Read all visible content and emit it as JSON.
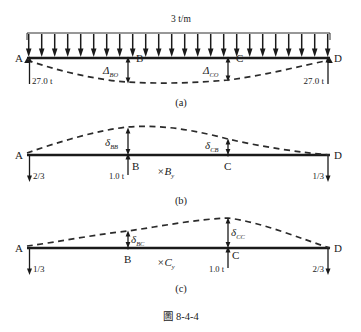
{
  "figure": {
    "caption": "圖 8-4-4",
    "nodes": [
      "A",
      "B",
      "C",
      "D"
    ],
    "panels": [
      {
        "id": "a",
        "panel_label": "(a)",
        "load_label": "3 t/m",
        "load_arrow_count": 24,
        "reaction_left": "27.0 t",
        "reaction_right": "27.0 t",
        "deflection_symbols": [
          {
            "base": "Δ",
            "sub": "BO",
            "at_node": "B"
          },
          {
            "base": "Δ",
            "sub": "CO",
            "at_node": "C"
          }
        ],
        "nodes": [
          "A",
          "B",
          "C",
          "D"
        ],
        "deflection_direction": "downward"
      },
      {
        "id": "b",
        "panel_label": "(b)",
        "unit_force": "1.0 t",
        "unit_force_at": "B",
        "redundant_label": "×B",
        "redundant_sub": "y",
        "reaction_left": "2/3",
        "reaction_right": "1/3",
        "deflection_symbols": [
          {
            "base": "δ",
            "sub": "BB",
            "at_node": "B"
          },
          {
            "base": "δ",
            "sub": "CB",
            "at_node": "C"
          }
        ],
        "nodes": [
          "A",
          "B",
          "C",
          "D"
        ],
        "deflection_direction": "upward"
      },
      {
        "id": "c",
        "panel_label": "(c)",
        "unit_force": "1.0 t",
        "unit_force_at": "C",
        "redundant_label": "×C",
        "redundant_sub": "y",
        "reaction_left": "1/3",
        "reaction_right": "2/3",
        "deflection_symbols": [
          {
            "base": "δ",
            "sub": "BC",
            "at_node": "B"
          },
          {
            "base": "δ",
            "sub": "CC",
            "at_node": "C"
          }
        ],
        "nodes": [
          "A",
          "B",
          "C",
          "D"
        ],
        "deflection_direction": "upward"
      }
    ],
    "colors": {
      "ink": "#1a1a1a",
      "background": "#ffffff"
    }
  }
}
